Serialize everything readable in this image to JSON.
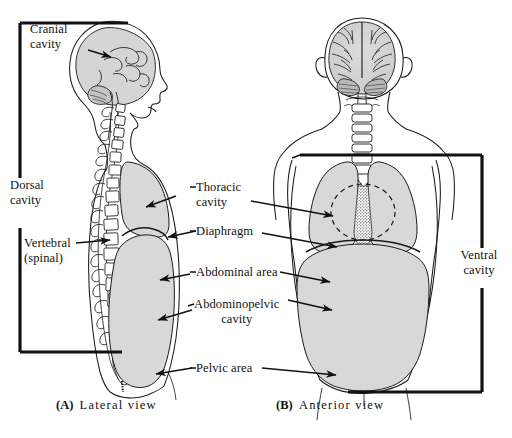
{
  "figure": {
    "background_color": "#ffffff",
    "ink_color": "#111111",
    "cavity_fill_color": "#d8d8d8",
    "panels": [
      {
        "id": "A",
        "marker": "(A)",
        "caption": "Lateral  view"
      },
      {
        "id": "B",
        "marker": "(B)",
        "caption": "Anterior  view"
      }
    ]
  },
  "brackets": {
    "dorsal": {
      "label_line1": "Dorsal",
      "label_line2": "cavity"
    },
    "ventral": {
      "label_line1": "Ventral",
      "label_line2": "cavity"
    }
  },
  "labels": {
    "cranial": {
      "line1": "Cranial",
      "line2": "cavity"
    },
    "vertebral": {
      "line1": "Vertebral",
      "line2": "(spinal)"
    },
    "thoracic": {
      "line1": "Thoracic",
      "line2": "cavity"
    },
    "diaphragm": {
      "line1": "Diaphragm"
    },
    "abdominal_area": {
      "line1": "Abdominal area"
    },
    "abdominopelvic": {
      "line1": "Abdominopelvic",
      "line2": "cavity"
    },
    "pelvic_area": {
      "line1": "Pelvic area"
    }
  }
}
